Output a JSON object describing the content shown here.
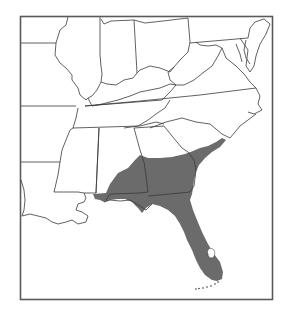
{
  "map": {
    "type": "species-range-map",
    "region": "Southeastern United States",
    "colors": {
      "range_fill": "#6b6b6b",
      "background": "#ffffff",
      "state_lines": "#3a3a3a",
      "frame": "#5a5a5a"
    },
    "states_shown": [
      "Missouri",
      "Illinois",
      "Indiana",
      "Ohio",
      "Pennsylvania",
      "Maryland",
      "Delaware",
      "Kentucky",
      "West Virginia",
      "Virginia",
      "Tennessee",
      "North Carolina",
      "Arkansas",
      "Mississippi",
      "Alabama",
      "Georgia",
      "South Carolina",
      "Louisiana",
      "Florida"
    ],
    "range": {
      "label": "Shaded distribution range",
      "covers": [
        "Florida (except Lake Okeechobee)",
        "Southern Georgia",
        "Southern Alabama",
        "Southeastern South Carolina coast",
        "Extreme southeastern Mississippi"
      ]
    }
  }
}
